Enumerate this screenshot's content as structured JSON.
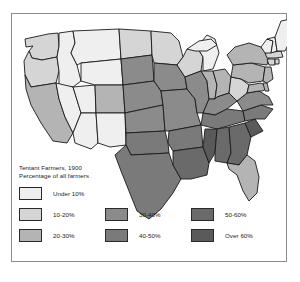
{
  "figure": {
    "kind": "choropleth-map",
    "region": "United States",
    "frame_color": "#8d8d8d",
    "background": "#ffffff",
    "outline_color": "#1a1a1a"
  },
  "legend": {
    "title_line1": "Tentant Farmers, 1900",
    "title_line2": "Percentage of all farmers",
    "rows": [
      {
        "cells": [
          {
            "label": "Under 10%",
            "color": "#efefef"
          },
          {
            "label": "",
            "color": ""
          },
          {
            "label": "",
            "color": ""
          }
        ]
      },
      {
        "cells": [
          {
            "label": "10-20%",
            "color": "#d5d5d5"
          },
          {
            "label": "30-40%",
            "color": "#8b8b8b"
          },
          {
            "label": "50-60%",
            "color": "#6a6a6a"
          }
        ]
      },
      {
        "cells": [
          {
            "label": "20-30%",
            "color": "#b4b4b4"
          },
          {
            "label": "40-50%",
            "color": "#7a7a7a"
          },
          {
            "label": "Over 60%",
            "color": "#5a5a5a"
          }
        ]
      }
    ],
    "classes": [
      {
        "name": "under-10",
        "label": "Under 10%",
        "color": "#efefef"
      },
      {
        "name": "10-20",
        "label": "10-20%",
        "color": "#d5d5d5"
      },
      {
        "name": "20-30",
        "label": "20-30%",
        "color": "#b4b4b4"
      },
      {
        "name": "30-40",
        "label": "30-40%",
        "color": "#8b8b8b"
      },
      {
        "name": "40-50",
        "label": "40-50%",
        "color": "#7a7a7a"
      },
      {
        "name": "50-60",
        "label": "50-60%",
        "color": "#6a6a6a"
      },
      {
        "name": "over-60",
        "label": "Over 60%",
        "color": "#5a5a5a"
      }
    ]
  },
  "map_data": {
    "type": "choropleth",
    "title": "Tentant Farmers, 1900",
    "subtitle": "Percentage of all farmers",
    "value_unit": "percent",
    "states": [
      {
        "code": "WA",
        "name": "Washington",
        "class": "10-20",
        "color": "#d5d5d5"
      },
      {
        "code": "OR",
        "name": "Oregon",
        "class": "10-20",
        "color": "#d5d5d5"
      },
      {
        "code": "CA",
        "name": "California",
        "class": "20-30",
        "color": "#b4b4b4"
      },
      {
        "code": "NV",
        "name": "Nevada",
        "class": "under-10",
        "color": "#efefef"
      },
      {
        "code": "ID",
        "name": "Idaho",
        "class": "under-10",
        "color": "#efefef"
      },
      {
        "code": "MT",
        "name": "Montana",
        "class": "under-10",
        "color": "#efefef"
      },
      {
        "code": "WY",
        "name": "Wyoming",
        "class": "under-10",
        "color": "#efefef"
      },
      {
        "code": "UT",
        "name": "Utah",
        "class": "under-10",
        "color": "#efefef"
      },
      {
        "code": "AZ",
        "name": "Arizona",
        "class": "under-10",
        "color": "#efefef"
      },
      {
        "code": "NM",
        "name": "New Mexico",
        "class": "under-10",
        "color": "#efefef"
      },
      {
        "code": "CO",
        "name": "Colorado",
        "class": "20-30",
        "color": "#b4b4b4"
      },
      {
        "code": "ND",
        "name": "North Dakota",
        "class": "10-20",
        "color": "#d5d5d5"
      },
      {
        "code": "SD",
        "name": "South Dakota",
        "class": "30-40",
        "color": "#8b8b8b"
      },
      {
        "code": "NE",
        "name": "Nebraska",
        "class": "30-40",
        "color": "#8b8b8b"
      },
      {
        "code": "KS",
        "name": "Kansas",
        "class": "30-40",
        "color": "#8b8b8b"
      },
      {
        "code": "OK",
        "name": "Oklahoma",
        "class": "40-50",
        "color": "#7a7a7a"
      },
      {
        "code": "TX",
        "name": "Texas",
        "class": "40-50",
        "color": "#7a7a7a"
      },
      {
        "code": "MN",
        "name": "Minnesota",
        "class": "10-20",
        "color": "#d5d5d5"
      },
      {
        "code": "IA",
        "name": "Iowa",
        "class": "30-40",
        "color": "#8b8b8b"
      },
      {
        "code": "MO",
        "name": "Missouri",
        "class": "30-40",
        "color": "#8b8b8b"
      },
      {
        "code": "AR",
        "name": "Arkansas",
        "class": "40-50",
        "color": "#7a7a7a"
      },
      {
        "code": "LA",
        "name": "Louisiana",
        "class": "50-60",
        "color": "#6a6a6a"
      },
      {
        "code": "WI",
        "name": "Wisconsin",
        "class": "10-20",
        "color": "#d5d5d5"
      },
      {
        "code": "IL",
        "name": "Illinois",
        "class": "30-40",
        "color": "#8b8b8b"
      },
      {
        "code": "MI",
        "name": "Michigan",
        "class": "under-10",
        "color": "#efefef"
      },
      {
        "code": "IN",
        "name": "Indiana",
        "class": "20-30",
        "color": "#b4b4b4"
      },
      {
        "code": "OH",
        "name": "Ohio",
        "class": "20-30",
        "color": "#b4b4b4"
      },
      {
        "code": "KY",
        "name": "Kentucky",
        "class": "30-40",
        "color": "#8b8b8b"
      },
      {
        "code": "TN",
        "name": "Tennessee",
        "class": "40-50",
        "color": "#7a7a7a"
      },
      {
        "code": "MS",
        "name": "Mississippi",
        "class": "over-60",
        "color": "#5a5a5a"
      },
      {
        "code": "AL",
        "name": "Alabama",
        "class": "50-60",
        "color": "#6a6a6a"
      },
      {
        "code": "GA",
        "name": "Georgia",
        "class": "50-60",
        "color": "#6a6a6a"
      },
      {
        "code": "FL",
        "name": "Florida",
        "class": "20-30",
        "color": "#b4b4b4"
      },
      {
        "code": "SC",
        "name": "South Carolina",
        "class": "over-60",
        "color": "#5a5a5a"
      },
      {
        "code": "NC",
        "name": "North Carolina",
        "class": "40-50",
        "color": "#7a7a7a"
      },
      {
        "code": "VA",
        "name": "Virginia",
        "class": "30-40",
        "color": "#8b8b8b"
      },
      {
        "code": "WV",
        "name": "West Virginia",
        "class": "10-20",
        "color": "#d5d5d5"
      },
      {
        "code": "MD",
        "name": "Maryland",
        "class": "20-30",
        "color": "#b4b4b4"
      },
      {
        "code": "DE",
        "name": "Delaware",
        "class": "20-30",
        "color": "#b4b4b4"
      },
      {
        "code": "PA",
        "name": "Pennsylvania",
        "class": "20-30",
        "color": "#b4b4b4"
      },
      {
        "code": "NJ",
        "name": "New Jersey",
        "class": "20-30",
        "color": "#b4b4b4"
      },
      {
        "code": "NY",
        "name": "New York",
        "class": "20-30",
        "color": "#b4b4b4"
      },
      {
        "code": "CT",
        "name": "Connecticut",
        "class": "10-20",
        "color": "#d5d5d5"
      },
      {
        "code": "RI",
        "name": "Rhode Island",
        "class": "10-20",
        "color": "#d5d5d5"
      },
      {
        "code": "MA",
        "name": "Massachusetts",
        "class": "10-20",
        "color": "#d5d5d5"
      },
      {
        "code": "VT",
        "name": "Vermont",
        "class": "under-10",
        "color": "#efefef"
      },
      {
        "code": "NH",
        "name": "New Hampshire",
        "class": "under-10",
        "color": "#efefef"
      },
      {
        "code": "ME",
        "name": "Maine",
        "class": "under-10",
        "color": "#efefef"
      }
    ]
  }
}
